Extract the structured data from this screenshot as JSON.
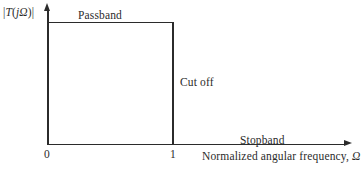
{
  "figure": {
    "kind": "ideal-lowpass-filter-magnitude-response"
  },
  "chart_data": {
    "type": "line",
    "title": "",
    "xlabel": "Normalized angular frequency, Ω",
    "ylabel": "|T(jΩ)|",
    "xlim": [
      0,
      2.4
    ],
    "ylim": [
      0,
      1.18
    ],
    "grid": false,
    "legend": null,
    "xticks": [
      0,
      1
    ],
    "xticklabels": [
      "0",
      "1"
    ],
    "yticks": [],
    "yticklabels": [],
    "series": [
      {
        "name": "Ideal brickwall magnitude response",
        "x": [
          0,
          1,
          1,
          2.4
        ],
        "values": [
          1,
          1,
          0,
          0
        ]
      }
    ],
    "annotations": [
      {
        "text": "Passband",
        "x": 0.5,
        "y": 1.1
      },
      {
        "text": "Cut off",
        "x": 1.06,
        "y": 0.5
      },
      {
        "text": "Stopband",
        "x": 1.55,
        "y": 0.08
      }
    ]
  },
  "axes": {
    "y_label_text": "|T(jΩ)|",
    "y_label_parts": {
      "bar_open": "|",
      "t": "T",
      "paren_open": "(",
      "j": "j",
      "omega": "Ω",
      "paren_close": ")",
      "bar_close": "|"
    },
    "x_label_text": "Normalized angular frequency, Ω",
    "x_label_name": "Normalized angular frequency,",
    "x_label_symbol": "Ω"
  },
  "ticks": {
    "origin": "0",
    "cutoff": "1"
  },
  "regions": {
    "passband": "Passband",
    "cutoff": "Cut off",
    "stopband": "Stopband"
  },
  "colors": {
    "ink": "#2b2b2b",
    "background": "#ffffff"
  }
}
